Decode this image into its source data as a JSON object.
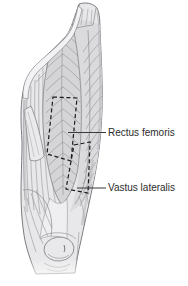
{
  "figure": {
    "colors": {
      "background": "#ffffff",
      "outline": "#6f6f74",
      "muscle_fill": "#e8e8ea",
      "fiber": "#909095",
      "dashed_site_outline": "#1a1a1a",
      "leader_line": "#3a3a3a",
      "label_text": "#2b2b2b"
    },
    "labels": [
      {
        "id": "rectus-femoris",
        "text": "Rectus femoris"
      },
      {
        "id": "vastus-lateralis",
        "text": "Vastus lateralis"
      }
    ]
  }
}
